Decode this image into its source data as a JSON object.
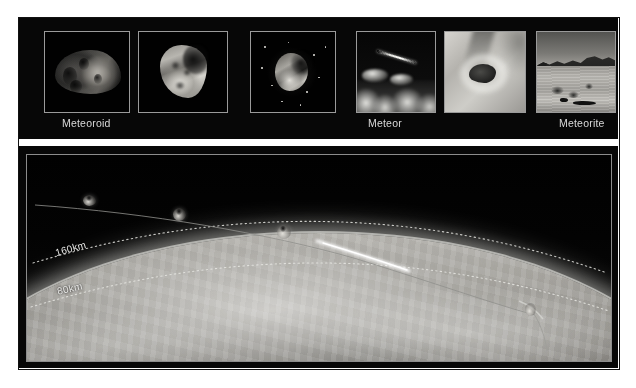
{
  "figure": {
    "background_color": "#070707",
    "text_color": "#d9d9d9"
  },
  "top_strip": {
    "thumbnails": [
      {
        "index": 1,
        "icon": "asteroid-dark-icon",
        "description": "Dark cratered asteroid in space",
        "stage": "Meteoroid"
      },
      {
        "index": 2,
        "icon": "asteroid-bright-icon",
        "description": "Bright irregular rocky asteroid",
        "stage": "Meteoroid"
      },
      {
        "index": 3,
        "icon": "asteroid-dust-icon",
        "description": "Asteroid surrounded by dust and stars",
        "stage": "Meteoroid"
      },
      {
        "index": 4,
        "icon": "meteor-streak-icon",
        "description": "Meteor streak above cloud layer",
        "stage": "Meteor"
      },
      {
        "index": 5,
        "icon": "fireball-icon",
        "description": "Close-up fireball glowing in atmosphere",
        "stage": "Meteor"
      },
      {
        "index": 6,
        "icon": "desert-landscape-icon",
        "description": "Desert landscape where meteorite landed",
        "stage": "Meteorite"
      }
    ],
    "captions": [
      {
        "label": "Meteoroid",
        "left_px": 44
      },
      {
        "label": "Meteor",
        "left_px": 350
      },
      {
        "label": "Meteorite",
        "left_px": 541
      }
    ]
  },
  "diagram": {
    "altitude_labels": [
      {
        "label": "160km",
        "value_km": 160,
        "left_px": 36,
        "top_px": 232,
        "rotation_deg": -16
      },
      {
        "label": "80km",
        "value_km": 80,
        "left_px": 38,
        "top_px": 272,
        "rotation_deg": -13
      }
    ],
    "stages": [
      {
        "name": "meteoroid-1",
        "left_px": 70,
        "top_px": 193,
        "size_px": 11,
        "state": "intact rock in space"
      },
      {
        "name": "meteoroid-2",
        "left_px": 160,
        "top_px": 205,
        "size_px": 12,
        "state": "intact rock approaching"
      },
      {
        "name": "meteor-entry",
        "left_px": 265,
        "top_px": 219,
        "size_px": 13,
        "state": "entering atmosphere, starting to glow"
      },
      {
        "name": "meteor-burn",
        "left_px": 330,
        "top_px": 229,
        "state": "bright burning streak"
      },
      {
        "name": "meteorite-fall",
        "left_px": 518,
        "top_px": 298,
        "size_px": 10,
        "state": "surviving fragment falling to Earth"
      }
    ],
    "earth": {
      "label": "Earth surface",
      "surface_type": "cloudy grayscale globe"
    }
  }
}
